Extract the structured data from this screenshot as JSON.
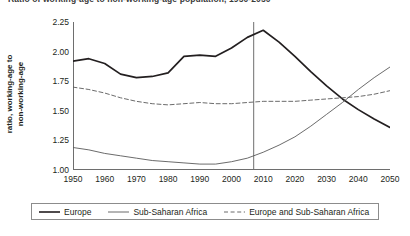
{
  "chart_data": {
    "type": "line",
    "title": "Ratio of working-age to non-working-age population, 1950-2050",
    "xlabel": "",
    "ylabel_line1": "ratio, working-age to",
    "ylabel_line2": "non-working-age",
    "xlim": [
      1950,
      2050
    ],
    "ylim": [
      1.0,
      2.25
    ],
    "grid": false,
    "legend_position": "bottom",
    "y_ticks": [
      "1.00",
      "1.25",
      "1.50",
      "1.75",
      "2.00",
      "2.25"
    ],
    "y_tick_values": [
      1.0,
      1.25,
      1.5,
      1.75,
      2.0,
      2.25
    ],
    "x_ticks": [
      "1950",
      "1960",
      "1970",
      "1980",
      "1990",
      "2000",
      "2010",
      "2020",
      "2030",
      "2040",
      "2050"
    ],
    "x_tick_values": [
      1950,
      1960,
      1970,
      1980,
      1990,
      2000,
      2010,
      2020,
      2030,
      2040,
      2050
    ],
    "x_minor_tick_values": [
      1955,
      1965,
      1975,
      1985,
      1995,
      2005,
      2015,
      2025,
      2035,
      2045
    ],
    "annotations": [
      {
        "name": "present-year-marker",
        "type": "vline",
        "x": 2007,
        "label": ""
      }
    ],
    "x": [
      1950,
      1955,
      1960,
      1965,
      1970,
      1975,
      1980,
      1985,
      1990,
      1995,
      2000,
      2005,
      2010,
      2015,
      2020,
      2025,
      2030,
      2035,
      2040,
      2045,
      2050
    ],
    "series": [
      {
        "name": "Europe",
        "style": "solid",
        "width": "thick",
        "color": "#231f20",
        "values": [
          1.92,
          1.94,
          1.9,
          1.81,
          1.78,
          1.79,
          1.82,
          1.96,
          1.97,
          1.96,
          2.03,
          2.12,
          2.18,
          2.08,
          1.96,
          1.83,
          1.71,
          1.6,
          1.51,
          1.43,
          1.36
        ]
      },
      {
        "name": "Sub-Saharan Africa",
        "style": "solid",
        "width": "thin",
        "color": "#5a5a5a",
        "values": [
          1.19,
          1.17,
          1.14,
          1.12,
          1.1,
          1.08,
          1.07,
          1.06,
          1.05,
          1.05,
          1.07,
          1.1,
          1.15,
          1.21,
          1.28,
          1.37,
          1.47,
          1.57,
          1.68,
          1.78,
          1.87
        ]
      },
      {
        "name": "Europe and Sub-Saharan Africa",
        "style": "dashed",
        "width": "thin",
        "color": "#5a5a5a",
        "values": [
          1.7,
          1.68,
          1.65,
          1.61,
          1.58,
          1.56,
          1.55,
          1.56,
          1.57,
          1.56,
          1.56,
          1.57,
          1.58,
          1.58,
          1.58,
          1.59,
          1.6,
          1.61,
          1.62,
          1.64,
          1.67
        ]
      }
    ]
  },
  "legend": {
    "items": [
      {
        "label": "Europe",
        "style": "solid-thick"
      },
      {
        "label": "Sub-Saharan Africa",
        "style": "solid-thin"
      },
      {
        "label": "Europe and Sub-Saharan Africa",
        "style": "dashed"
      }
    ]
  }
}
